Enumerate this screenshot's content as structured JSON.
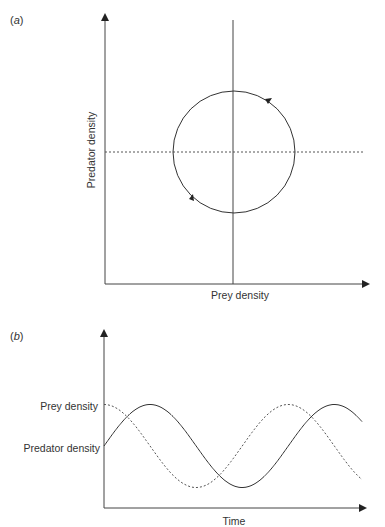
{
  "figure": {
    "panel_a": {
      "label_open": "(",
      "label_letter": "a",
      "label_close": ")",
      "xlabel": "Prey density",
      "ylabel": "Predator density"
    },
    "panel_b": {
      "label_open": "(",
      "label_letter": "b",
      "label_close": ")",
      "xlabel": "Time",
      "series_labels": [
        "Prey density",
        "Predator density"
      ]
    },
    "colors": {
      "line": "#333333",
      "background": "#ffffff"
    }
  },
  "chart_data": [
    {
      "type": "line",
      "title": "(a) Predator–prey phase plane",
      "xlabel": "Prey density",
      "ylabel": "Predator density",
      "description": "Closed counter-clockwise cycle around the equilibrium point where prey isocline (vertical solid line) and predator isocline (horizontal dashed line) intersect",
      "equilibrium": {
        "prey": 0.5,
        "predator": 0.5
      },
      "cycle": {
        "center": [
          0.5,
          0.5
        ],
        "radius_rel": 0.23,
        "direction": "counter-clockwise"
      },
      "isoclines": [
        {
          "name": "prey isocline",
          "orientation": "vertical",
          "style": "solid",
          "at": 0.5
        },
        {
          "name": "predator isocline",
          "orientation": "horizontal",
          "style": "dashed",
          "at": 0.5
        }
      ],
      "xlim": [
        0,
        1
      ],
      "ylim": [
        0,
        1
      ],
      "grid": false
    },
    {
      "type": "line",
      "title": "(b) Densities over time",
      "xlabel": "Time",
      "ylabel": "",
      "series": [
        {
          "name": "Prey density",
          "style": "dashed",
          "phase": 0.0,
          "amplitude": 1,
          "period": 1.0,
          "offset": 0
        },
        {
          "name": "Predator density",
          "style": "solid",
          "phase": -0.25,
          "amplitude": 1,
          "period": 1.0,
          "offset": 0
        }
      ],
      "x_range_periods": [
        0,
        1.4
      ],
      "ytick_labels": [
        "Prey density",
        "Predator density"
      ],
      "note": "Both oscillate with equal period; predator lags prey by a quarter cycle",
      "grid": false
    }
  ]
}
